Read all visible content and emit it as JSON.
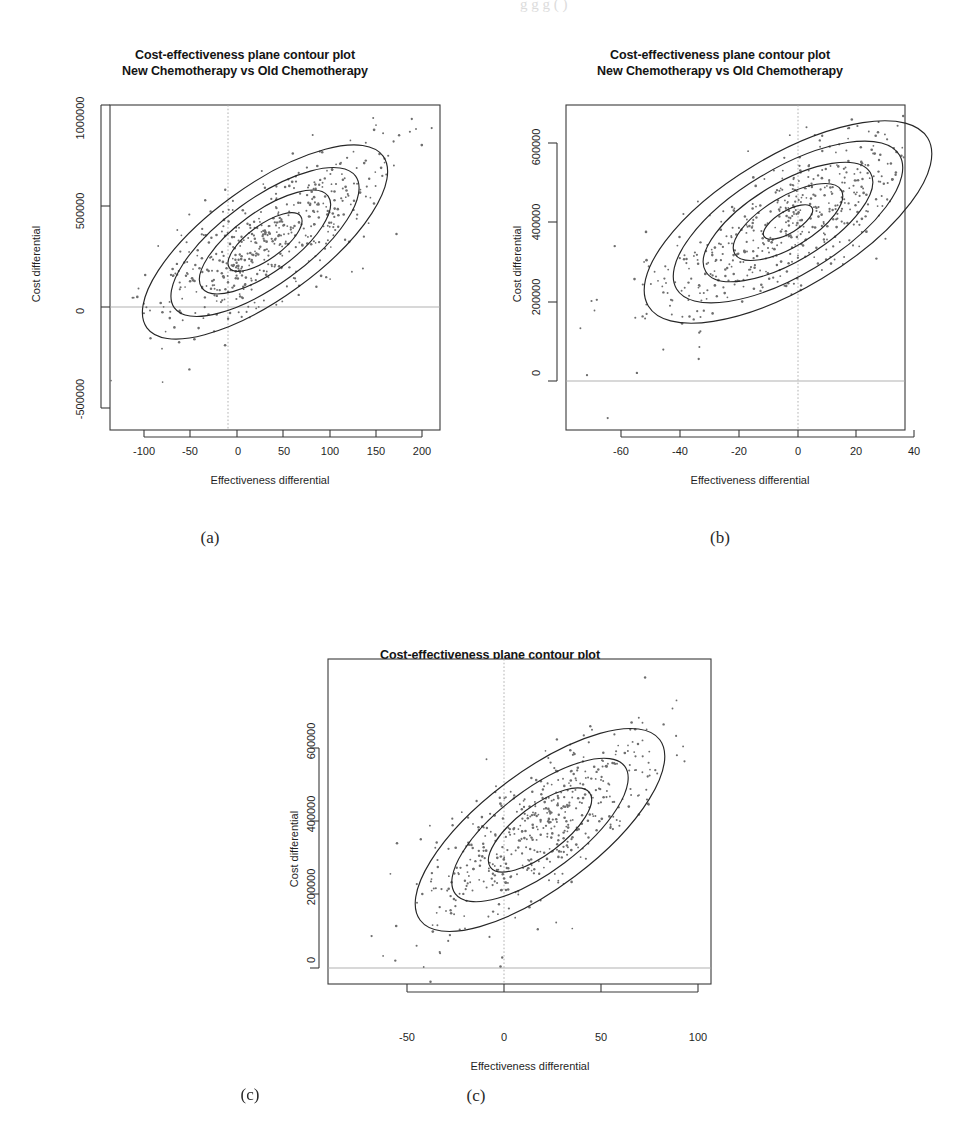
{
  "page": {
    "background": "#ffffff",
    "top_cut_text": "g g g ( )"
  },
  "common": {
    "title": "Cost-effectiveness plane contour plot\nNew Chemotherapy vs Old Chemotherapy",
    "xlabel": "Effectiveness differential",
    "ylabel": "Cost differential"
  },
  "captions": {
    "a": "(a)",
    "b": "(b)",
    "c": "(c)"
  },
  "chart_data": [
    {
      "id": "panel-a",
      "type": "scatter",
      "title": "Cost-effectiveness plane contour plot\nNew Chemotherapy vs Old Chemotherapy",
      "xlabel": "Effectiveness differential",
      "ylabel": "Cost differential",
      "grid": false,
      "legend": "none",
      "xlim": [
        -135,
        235
      ],
      "ylim": [
        -700000,
        1120000
      ],
      "xticks": [
        -100,
        -50,
        0,
        50,
        100,
        150,
        200
      ],
      "xticklabels": [
        "-100",
        "-50",
        "0",
        "50",
        "100",
        "150",
        "200"
      ],
      "yticks": [
        -500000,
        0,
        500000,
        1000000
      ],
      "yticklabels": [
        "-500000",
        "0",
        "500000",
        "1000000"
      ],
      "reference_lines": {
        "x": 0,
        "y": 0
      },
      "annotations": [
        {
          "position": "top-left",
          "text": "Pr(Δe ≤ 0, Δc > 0) = 0.19",
          "value": 0.19
        },
        {
          "position": "top-right",
          "text": "Pr(Δe > 0, Δc > 0) = 0.78",
          "value": 0.78
        },
        {
          "position": "bottom-left",
          "text": "Pr(Δe ≤ 0, Δc ≤ 0) = 0",
          "value": 0
        },
        {
          "position": "bottom-right",
          "text": "Pr(Δe > 0, Δc ≤ 0) = 0.03",
          "value": 0.03
        }
      ],
      "distribution": {
        "center": [
          40,
          300000
        ],
        "x_sd": 38,
        "y_sd": 160000,
        "correlation": -0.72,
        "n_points": 520
      },
      "contours": {
        "count": 4,
        "levels": [
          0.5,
          1.0,
          1.5,
          2.0
        ],
        "shape": "ellipse"
      }
    },
    {
      "id": "panel-b",
      "type": "scatter",
      "title": "Cost-effectiveness plane contour plot\nNew Chemotherapy vs Old Chemotherapy",
      "xlabel": "Effectiveness differential",
      "ylabel": "Cost differential",
      "grid": false,
      "legend": "none",
      "xlim": [
        -73,
        57
      ],
      "ylim": [
        -160000,
        730000
      ],
      "xticks": [
        -60,
        -40,
        -20,
        0,
        20,
        40
      ],
      "xticklabels": [
        "-60",
        "-40",
        "-20",
        "0",
        "20",
        "40"
      ],
      "yticks": [
        0,
        200000,
        400000,
        600000
      ],
      "yticklabels": [
        "0",
        "200000",
        "400000",
        "600000"
      ],
      "reference_lines": {
        "x": 0,
        "y": 0
      },
      "annotations": [
        {
          "position": "top-left",
          "text": "Pr(Δe ≤ 0, Δc >0) = 0.494",
          "value": 0.494
        },
        {
          "position": "top-right",
          "text": "Pr(Δe > 0, Δc > 0) = 0.506",
          "value": 0.506
        },
        {
          "position": "bottom-left",
          "text": "Pr(Δe ≤ 0, Δc ≤ 0) = 0",
          "value": 0
        },
        {
          "position": "bottom-right",
          "text": "Pr(Δe > 0, Δc ≤ 0) = 0",
          "value": 0
        }
      ],
      "distribution": {
        "center": [
          0,
          400000
        ],
        "x_sd": 17,
        "y_sd": 72000,
        "correlation": -0.6,
        "n_points": 540
      },
      "contours": {
        "count": 5,
        "levels": [
          0.4,
          0.9,
          1.4,
          1.9,
          2.4
        ],
        "shape": "ellipse"
      }
    },
    {
      "id": "panel-c",
      "type": "scatter",
      "title": "Cost-effectiveness plane contour plot\nNew Chemotherapy vs Old Chemotherapy",
      "xlabel": "Effectiveness differential",
      "ylabel": "Cost differential",
      "grid": false,
      "legend": "none",
      "xlim": [
        -90,
        128
      ],
      "ylim": [
        -60000,
        740000
      ],
      "xticks": [
        -50,
        0,
        50,
        100
      ],
      "xticklabels": [
        "-50",
        "0",
        "50",
        "100"
      ],
      "yticks": [
        0,
        200000,
        400000,
        600000
      ],
      "yticklabels": [
        "0",
        "200000",
        "400000",
        "600000"
      ],
      "reference_lines": {
        "x": 0,
        "y": 0
      },
      "annotations": [
        {
          "position": "top-left",
          "text": "Pr(Δe ≤ 0, Δc > 0) = 0.212",
          "value": 0.212
        },
        {
          "position": "top-right",
          "text": "Pr(Δe > 0, Δc > 0) = 0.786",
          "value": 0.786
        },
        {
          "position": "bottom-left",
          "text": "Pr(Δe ≤ 0, Δc ≤ 0) = 0",
          "value": 0
        },
        {
          "position": "bottom-right",
          "text": "Pr(Δe > 0, Δc ≤ 0) = 0.002",
          "value": 0.002
        }
      ],
      "distribution": {
        "center": [
          22,
          355000
        ],
        "x_sd": 26,
        "y_sd": 82000,
        "correlation": -0.68,
        "n_points": 520
      },
      "contours": {
        "count": 3,
        "levels": [
          0.7,
          1.4,
          2.1
        ],
        "shape": "ellipse"
      }
    }
  ]
}
